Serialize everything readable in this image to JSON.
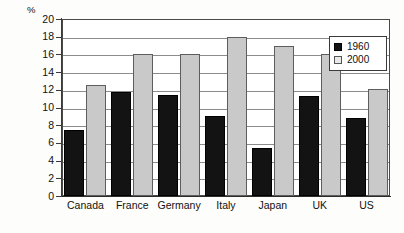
{
  "chart_data": {
    "type": "bar",
    "title": "",
    "subtitle": "",
    "xlabel": "",
    "ylabel": "%",
    "ylim": [
      0,
      20
    ],
    "ytick_step": 2,
    "yticks": [
      0,
      2,
      4,
      6,
      8,
      10,
      12,
      14,
      16,
      18,
      20
    ],
    "ytick_labels": [
      "0",
      "2",
      "4",
      "6",
      "8",
      "10",
      "12",
      "14",
      "16",
      "18",
      "20"
    ],
    "grid": "horizontal",
    "legend_position": "top-right",
    "categories": [
      "Canada",
      "France",
      "Germany",
      "Italy",
      "Japan",
      "UK",
      "US"
    ],
    "series": [
      {
        "name": "1960",
        "color": "#131313",
        "values": [
          7.5,
          11.7,
          11.4,
          9.0,
          5.4,
          11.3,
          8.8
        ]
      },
      {
        "name": "2000",
        "color": "#c9c9c9",
        "values": [
          12.5,
          16.0,
          16.0,
          18.0,
          17.0,
          16.0,
          12.1
        ]
      }
    ]
  },
  "legend": {
    "entries": [
      {
        "label": "1960",
        "swatch": "black-square-icon"
      },
      {
        "label": "2000",
        "swatch": "gray-square-icon"
      }
    ]
  },
  "axes": {
    "y_unit_label": "%"
  }
}
